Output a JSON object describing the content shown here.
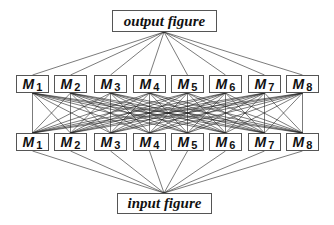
{
  "diagram": {
    "output_label": "output figure",
    "input_label": "input figure",
    "upper_layer": [
      {
        "letter": "M",
        "sub": "1"
      },
      {
        "letter": "M",
        "sub": "2"
      },
      {
        "letter": "M",
        "sub": "3"
      },
      {
        "letter": "M",
        "sub": "4"
      },
      {
        "letter": "M",
        "sub": "5"
      },
      {
        "letter": "M",
        "sub": "6"
      },
      {
        "letter": "M",
        "sub": "7"
      },
      {
        "letter": "M",
        "sub": "8"
      }
    ],
    "lower_layer": [
      {
        "letter": "M",
        "sub": "1"
      },
      {
        "letter": "M",
        "sub": "2"
      },
      {
        "letter": "M",
        "sub": "3"
      },
      {
        "letter": "M",
        "sub": "4"
      },
      {
        "letter": "M",
        "sub": "5"
      },
      {
        "letter": "M",
        "sub": "6"
      },
      {
        "letter": "M",
        "sub": "7"
      },
      {
        "letter": "M",
        "sub": "8"
      }
    ],
    "connections": "fully-connected between M layers; all M nodes converge to output and input figures",
    "line_color": "#222222",
    "box_border_color": "#555555"
  }
}
